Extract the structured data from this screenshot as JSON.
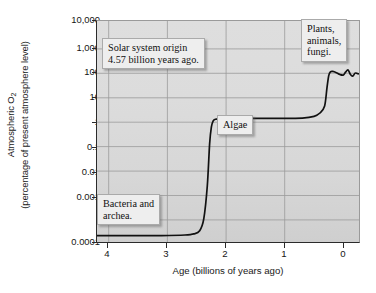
{
  "figure": {
    "name": "atmospheric-oxygen-history-chart"
  },
  "axes": {
    "ylabel_line1": "Atmospheric O",
    "ylabel_sub": "2",
    "ylabel_line2": "(percentage of present atmosphere level)",
    "xlabel": "Age (billions of years ago)",
    "yticks": [
      "10,000",
      "1,000",
      "100",
      "10",
      "1",
      "0.1",
      "0.01",
      "0.001",
      "0.0001"
    ],
    "xticks": [
      "4",
      "3",
      "2",
      "1",
      "0"
    ]
  },
  "callouts": {
    "solar": "Solar system origin\n4.57 billion years ago.",
    "plants": "Plants,\nanimals,\nfungi.",
    "algae": "Algae",
    "bacteria": "Bacteria and\narchea."
  },
  "colors": {
    "plot_background": "#dcdcdc",
    "grid": "#9a9a9a",
    "axis": "#2b2b2b",
    "curve": "#111111",
    "callout_background": "#eeeeee",
    "callout_border": "#aaaaaa",
    "page_background": "#ffffff"
  },
  "chart_data": {
    "type": "line",
    "title": "",
    "xlabel": "Age (billions of years ago)",
    "ylabel": "Atmospheric O2 (percentage of present atmosphere level)",
    "xlim": [
      4.5,
      0
    ],
    "ylim": [
      0.0001,
      10000
    ],
    "yscale": "log",
    "xscale": "linear",
    "x_reversed": true,
    "grid": true,
    "legend": false,
    "xticks": [
      4,
      3,
      2,
      1,
      0
    ],
    "yticks": [
      0.0001,
      0.001,
      0.01,
      0.1,
      1,
      10,
      100,
      1000,
      10000
    ],
    "series": [
      {
        "name": "Atmospheric O2",
        "x": [
          4.5,
          4.2,
          3.8,
          3.4,
          3.0,
          2.85,
          2.75,
          2.68,
          2.62,
          2.58,
          2.55,
          2.52,
          2.48,
          2.4,
          2.2,
          1.8,
          1.4,
          1.0,
          0.8,
          0.7,
          0.62,
          0.58,
          0.55,
          0.52,
          0.48,
          0.42,
          0.36,
          0.3,
          0.26,
          0.22,
          0.18,
          0.14,
          0.1,
          0.06,
          0.02,
          0.0
        ],
        "y": [
          0.0002,
          0.0002,
          0.0002,
          0.0002,
          0.00021,
          0.00023,
          0.0003,
          0.0008,
          0.012,
          0.4,
          1.6,
          2.6,
          3.0,
          3.1,
          3.2,
          3.2,
          3.2,
          3.3,
          3.8,
          5.0,
          9.0,
          40,
          110,
          150,
          155,
          140,
          120,
          115,
          150,
          175,
          120,
          105,
          135,
          130,
          125,
          130
        ]
      }
    ],
    "annotations": [
      {
        "text": "Solar system origin 4.57 billion years ago.",
        "x": 4.0,
        "y": 700
      },
      {
        "text": "Plants, animals, fungi.",
        "x": 0.62,
        "y": 3000
      },
      {
        "text": "Algae",
        "x": 1.85,
        "y": 0.35
      },
      {
        "text": "Bacteria and archea.",
        "x": 4.25,
        "y": 0.0012
      }
    ]
  }
}
